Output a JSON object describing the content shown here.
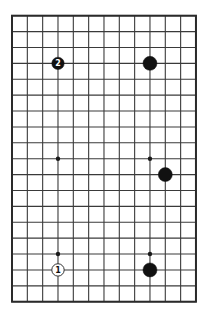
{
  "board": {
    "columns": 13,
    "rows": 19,
    "origin_x": 12,
    "origin_y": 15.7,
    "spacing_x": 15.33,
    "spacing_y": 15.89,
    "line_color": "#3a3a3a",
    "border_color": "#2a2a2a",
    "background": "#ffffff"
  },
  "star_points": [
    {
      "col": 3,
      "row": 3
    },
    {
      "col": 9,
      "row": 3
    },
    {
      "col": 3,
      "row": 9
    },
    {
      "col": 9,
      "row": 9
    },
    {
      "col": 3,
      "row": 15
    },
    {
      "col": 9,
      "row": 15
    }
  ],
  "stones": [
    {
      "col": 3,
      "row": 3,
      "color": "black",
      "label": "2",
      "radius": 6.2
    },
    {
      "col": 9,
      "row": 3,
      "color": "black",
      "label": "",
      "radius": 7
    },
    {
      "col": 10,
      "row": 10,
      "color": "black",
      "label": "",
      "radius": 7
    },
    {
      "col": 3,
      "row": 16,
      "color": "white",
      "label": "1",
      "radius": 6.2
    },
    {
      "col": 9,
      "row": 16,
      "color": "black",
      "label": "",
      "radius": 7
    }
  ],
  "colors": {
    "black_stone": "#111111",
    "white_stone": "#ffffff",
    "white_stone_outline": "#333333",
    "label_on_black": "#ffffff",
    "label_on_white": "#111111",
    "star_point": "#1a1a1a"
  }
}
